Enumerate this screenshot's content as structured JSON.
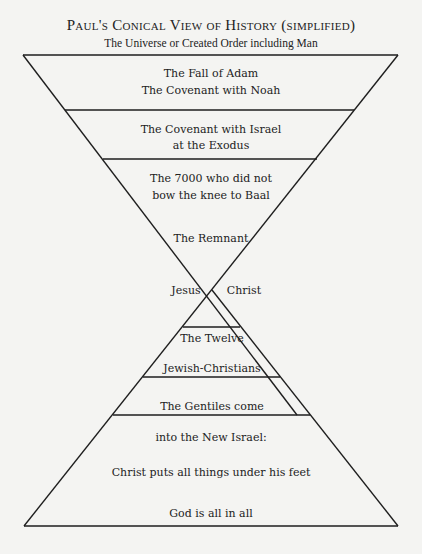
{
  "title": "Paul's Conical View of History (simplified)",
  "subtitle": "The Universe or Created Order including Man",
  "upper_cone": {
    "bands": [
      {
        "lines": [
          "The Fall of Adam",
          "The Covenant with Noah"
        ]
      },
      {
        "lines": [
          "The Covenant with Israel",
          "at the Exodus"
        ]
      },
      {
        "lines": [
          "The 7000 who did not",
          "bow the knee to Baal"
        ]
      },
      {
        "lines": [
          "The Remnant"
        ]
      }
    ]
  },
  "apex": {
    "left": "Jesus",
    "right": "Christ"
  },
  "lower_cone": {
    "bands": [
      {
        "lines": [
          "The Twelve"
        ]
      },
      {
        "lines": [
          "Jewish-Christians"
        ]
      },
      {
        "lines": [
          "The Gentiles come"
        ]
      },
      {
        "lines": [
          "into the New Israel:",
          "Christ puts all things under his feet",
          "God is all in all"
        ]
      }
    ]
  },
  "colors": {
    "line": "#1e1e1e",
    "background": "#f4f4f2",
    "text": "#222222"
  }
}
